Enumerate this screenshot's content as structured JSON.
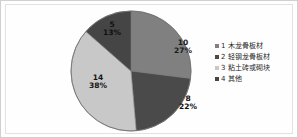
{
  "chart_data": {
    "type": "pie",
    "title": "",
    "subtitle": "",
    "xlabel": "",
    "ylabel": "",
    "grid": false,
    "legend_position": "right",
    "total": 37,
    "categories": [
      "1 木龙骨板材",
      "2 轻钢龙骨板材",
      "3 粘土砖或砌块",
      "4 其他"
    ],
    "values": [
      10,
      8,
      14,
      5
    ],
    "percent_labels": [
      "27%",
      "22%",
      "38%",
      "13%"
    ],
    "percents": [
      27,
      22,
      38,
      13
    ],
    "colors": [
      "#808080",
      "#4a4a4a",
      "#c8c8c8",
      "#454545"
    ],
    "slices": [
      {
        "key": "slice-1",
        "label": "1 木龙骨板材",
        "value_label": "10",
        "percent_label": "27%",
        "value": 10,
        "percent": 27,
        "color": "#808080",
        "start_angle": 0,
        "end_angle": 97.2
      },
      {
        "key": "slice-2",
        "label": "2 轻钢龙骨板材",
        "value_label": "8",
        "percent_label": "22%",
        "value": 8,
        "percent": 22,
        "color": "#4a4a4a",
        "start_angle": 97.2,
        "end_angle": 175.0
      },
      {
        "key": "slice-3",
        "label": "3 粘土砖或砌块",
        "value_label": "14",
        "percent_label": "38%",
        "value": 14,
        "percent": 38,
        "color": "#c8c8c8",
        "start_angle": 175.0,
        "end_angle": 311.3
      },
      {
        "key": "slice-4",
        "label": "4 其他",
        "value_label": "5",
        "percent_label": "13%",
        "value": 5,
        "percent": 13,
        "color": "#454545",
        "start_angle": 311.3,
        "end_angle": 360
      }
    ]
  },
  "legend": {
    "items": [
      {
        "label": "1 木龙骨板材",
        "color": "#808080"
      },
      {
        "label": "2 轻钢龙骨板材",
        "color": "#4a4a4a"
      },
      {
        "label": "3 粘土砖或砌块",
        "color": "#c8c8c8"
      },
      {
        "label": "4 其他",
        "color": "#454545"
      }
    ]
  },
  "figure": {
    "background": "#fefefe",
    "border_color": "#d0d0d0",
    "pie_outline_color": "#6f6f6f"
  }
}
